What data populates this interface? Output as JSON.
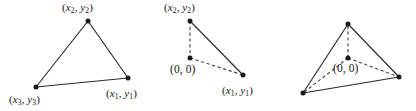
{
  "figure": {
    "background_color": "#ffffff",
    "stroke_color": "#2b2b2b",
    "dashed_color": "#4a4a4a",
    "vertex_color": "#1a1a1a",
    "text_color": "#141414"
  },
  "panels": [
    {
      "name": "triangle-vertices-labeled",
      "labels": {
        "top": "(x2, y2)",
        "bottom_left": "(x3, y3)",
        "bottom_right": "(x1, y1)"
      },
      "vertices": [
        {
          "name": "top",
          "x": 88,
          "y": 21
        },
        {
          "name": "bottom-left",
          "x": 36,
          "y": 87
        },
        {
          "name": "bottom-right",
          "x": 128,
          "y": 78
        }
      ],
      "edges": [
        {
          "from": "top",
          "to": "bottom-left",
          "style": "solid"
        },
        {
          "from": "bottom-left",
          "to": "bottom-right",
          "style": "solid"
        },
        {
          "from": "bottom-right",
          "to": "top",
          "style": "solid"
        }
      ]
    },
    {
      "name": "triangle-with-origin-at-edge",
      "labels": {
        "top": "(x2, y2)",
        "origin": "(0, 0)",
        "bottom_right": "(x1, y1)"
      },
      "vertices": [
        {
          "name": "top",
          "x": 190,
          "y": 21
        },
        {
          "name": "origin",
          "x": 190,
          "y": 58
        },
        {
          "name": "bottom-right",
          "x": 243,
          "y": 75
        }
      ],
      "edges": [
        {
          "from": "top",
          "to": "bottom-right",
          "style": "solid"
        },
        {
          "from": "top",
          "to": "origin",
          "style": "dashed"
        },
        {
          "from": "origin",
          "to": "bottom-right",
          "style": "dashed"
        }
      ]
    },
    {
      "name": "triangle-with-interior-origin",
      "labels": {
        "origin": "(0, 0)"
      },
      "vertices": [
        {
          "name": "top",
          "x": 348,
          "y": 24
        },
        {
          "name": "bottom-left",
          "x": 303,
          "y": 93
        },
        {
          "name": "bottom-right",
          "x": 399,
          "y": 77
        },
        {
          "name": "origin",
          "x": 348,
          "y": 58
        }
      ],
      "edges": [
        {
          "from": "top",
          "to": "bottom-left",
          "style": "solid"
        },
        {
          "from": "bottom-left",
          "to": "bottom-right",
          "style": "solid"
        },
        {
          "from": "bottom-right",
          "to": "top",
          "style": "solid"
        },
        {
          "from": "origin",
          "to": "top",
          "style": "dashed"
        },
        {
          "from": "origin",
          "to": "bottom-left",
          "style": "dashed"
        },
        {
          "from": "origin",
          "to": "bottom-right",
          "style": "dashed"
        }
      ]
    }
  ],
  "text": {
    "x_var": "x",
    "y_var": "y",
    "sub1": "1",
    "sub2": "2",
    "sub3": "3",
    "open_paren": "(",
    "close_paren": ")",
    "comma": ",",
    "zero": "0",
    "origin_label": "(0, 0)"
  }
}
